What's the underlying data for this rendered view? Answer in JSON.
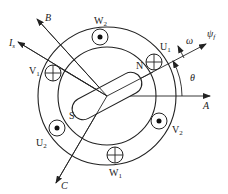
{
  "diagram": {
    "axes": {
      "A": "A",
      "B": "B",
      "C": "C",
      "current": {
        "base": "I",
        "sub": "s"
      },
      "flux": {
        "base": "ψ",
        "sub": "f"
      },
      "speed": "ω",
      "angle": "θ"
    },
    "rotor_poles": {
      "north": "N",
      "south": "S"
    },
    "coils": [
      {
        "id": "W2",
        "base": "W",
        "sub": "2",
        "type": "dot"
      },
      {
        "id": "U1",
        "base": "U",
        "sub": "1",
        "type": "cross"
      },
      {
        "id": "V2",
        "base": "V",
        "sub": "2",
        "type": "dot"
      },
      {
        "id": "W1",
        "base": "W",
        "sub": "1",
        "type": "cross"
      },
      {
        "id": "U2",
        "base": "U",
        "sub": "2",
        "type": "dot"
      },
      {
        "id": "V1",
        "base": "V",
        "sub": "1",
        "type": "cross"
      }
    ],
    "colors": {
      "stroke": "#222222",
      "background": "#ffffff"
    }
  }
}
